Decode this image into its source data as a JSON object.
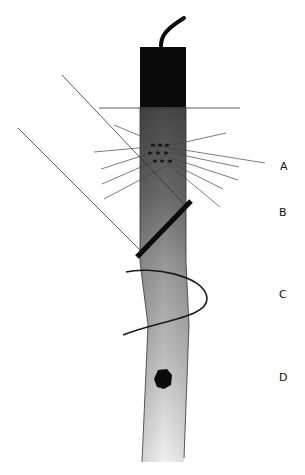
{
  "diagram": {
    "colors": {
      "cap": "#0a0a0a",
      "tube_top": "#4a4a4a",
      "tube_mid": "#8a8a8a",
      "tube_bottom": "#e6e6e6",
      "line": "#333333",
      "bar": "#0a0a0a",
      "blob": "#0a0a0a"
    },
    "labels": [
      {
        "id": "A",
        "text": "A",
        "x": 280,
        "y": 160
      },
      {
        "id": "B",
        "text": "B",
        "x": 279,
        "y": 206
      },
      {
        "id": "C",
        "text": "C",
        "x": 279,
        "y": 288
      },
      {
        "id": "D",
        "text": "D",
        "x": 279,
        "y": 371
      }
    ]
  }
}
